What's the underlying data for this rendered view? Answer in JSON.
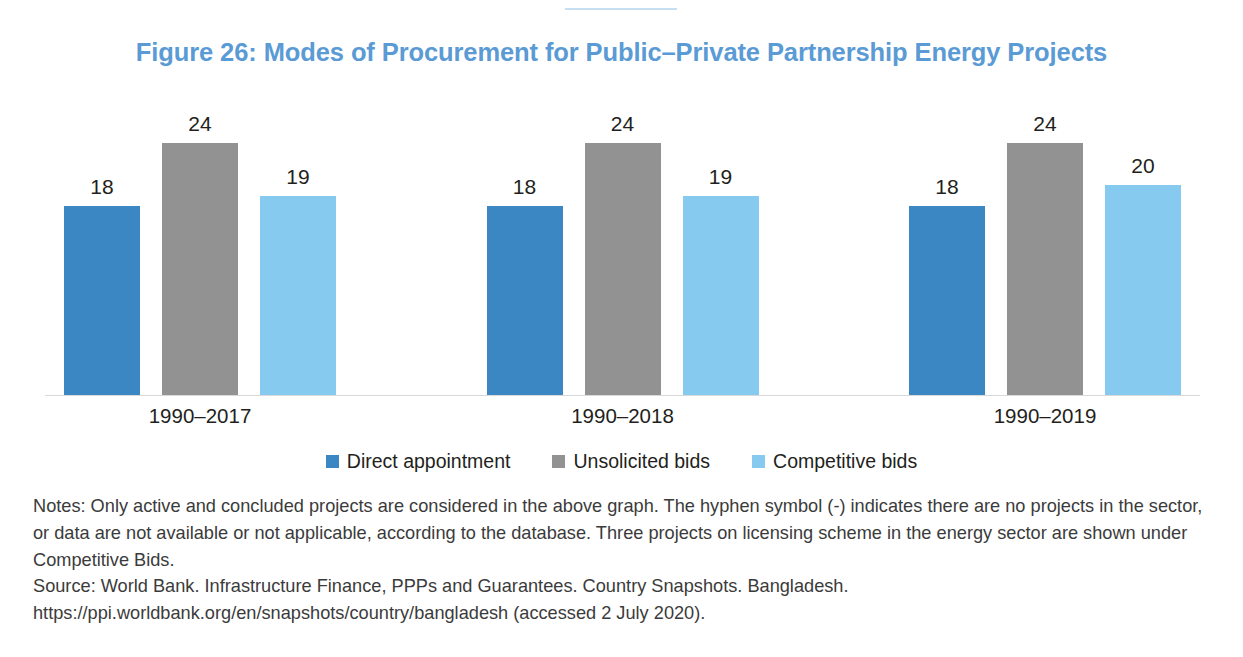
{
  "figure": {
    "title": "Figure 26: Modes of Procurement for Public–Private Partnership Energy Projects",
    "title_color": "#5B9BD5"
  },
  "notes": {
    "notes_text": "Notes: Only active and concluded projects are considered in the above graph. The hyphen symbol (-) indicates there are no projects in the sector, or data are not available or not applicable, according to the database. Three projects on licensing scheme in the energy sector are shown under Competitive Bids.",
    "source_text": "Source: World Bank. Infrastructure Finance, PPPs and Guarantees. Country Snapshots. Bangladesh. https://ppi.worldbank.org/en/snapshots/country/bangladesh (accessed 2 July 2020)."
  },
  "chart_data": {
    "type": "bar",
    "title": "Figure 26: Modes of Procurement for Public–Private Partnership Energy Projects",
    "xlabel": "",
    "ylabel": "",
    "ylim": [
      0,
      26
    ],
    "grid": false,
    "legend_position": "bottom-center",
    "categories": [
      "1990–2017",
      "1990–2018",
      "1990–2019"
    ],
    "series": [
      {
        "name": "Direct appointment",
        "color": "#3B87C4",
        "values": [
          18,
          18,
          18
        ]
      },
      {
        "name": "Unsolicited bids",
        "color": "#929292",
        "values": [
          24,
          24,
          24
        ]
      },
      {
        "name": "Competitive bids",
        "color": "#86CAF0",
        "values": [
          19,
          19,
          20
        ]
      }
    ],
    "data_labels": [
      [
        18,
        24,
        19
      ],
      [
        18,
        24,
        19
      ],
      [
        18,
        24,
        20
      ]
    ]
  }
}
